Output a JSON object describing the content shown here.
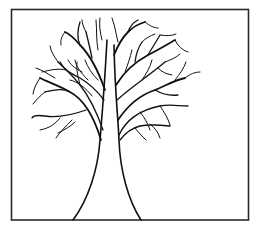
{
  "illustration": {
    "subject": "bare tree line drawing",
    "style": "black ink outline on white",
    "colors": {
      "ink": "#111111",
      "frame": "#2a2a2a",
      "background": "#ffffff"
    }
  },
  "frame": {
    "x": 11,
    "y": 9,
    "width": 238,
    "height": 211
  }
}
